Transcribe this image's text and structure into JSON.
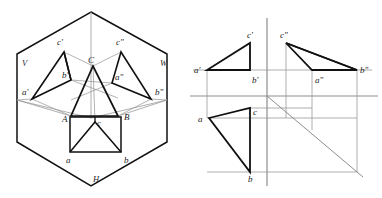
{
  "figure": {
    "background_color": "#ffffff",
    "heavy_line_color": "#111111",
    "light_line_color": "#9a9a9a",
    "axis_line_color": "#8d8d8d",
    "label_color": "#1b1b1b"
  },
  "left_view": {
    "name": "pictorial-projection-box",
    "plane_labels": [
      {
        "id": "V",
        "text": "V",
        "x": 22,
        "y": 66
      },
      {
        "id": "W",
        "text": "W",
        "x": 160,
        "y": 66
      },
      {
        "id": "H",
        "text": "H",
        "x": 93,
        "y": 182
      }
    ],
    "point_labels": [
      {
        "id": "c-front",
        "text": "c'",
        "x": 57,
        "y": 45
      },
      {
        "id": "b-front",
        "text": "b'",
        "x": 62,
        "y": 78
      },
      {
        "id": "a-front",
        "text": "a'",
        "x": 22,
        "y": 95
      },
      {
        "id": "c-side",
        "text": "c\"",
        "x": 116,
        "y": 45
      },
      {
        "id": "a-side",
        "text": "a\"",
        "x": 115,
        "y": 80
      },
      {
        "id": "b-side",
        "text": "b\"",
        "x": 155,
        "y": 95
      },
      {
        "id": "C-space",
        "text": "C",
        "x": 88,
        "y": 63
      },
      {
        "id": "A-space",
        "text": "A",
        "x": 62,
        "y": 120
      },
      {
        "id": "B-space",
        "text": "B",
        "x": 124,
        "y": 118
      },
      {
        "id": "c-top",
        "text": "c",
        "x": 93,
        "y": 124
      },
      {
        "id": "a-top",
        "text": "a",
        "x": 66,
        "y": 161
      },
      {
        "id": "b-top",
        "text": "b",
        "x": 124,
        "y": 161
      }
    ],
    "hexagon_vertices": [
      {
        "x": 91,
        "y": 12
      },
      {
        "x": 167,
        "y": 54
      },
      {
        "x": 167,
        "y": 142
      },
      {
        "x": 91,
        "y": 186
      },
      {
        "x": 17,
        "y": 142
      },
      {
        "x": 17,
        "y": 54
      }
    ],
    "front_triangle": [
      {
        "id": "a'",
        "x": 32,
        "y": 99
      },
      {
        "id": "b'",
        "x": 71,
        "y": 80
      },
      {
        "id": "c'",
        "x": 64,
        "y": 52
      }
    ],
    "side_triangle": [
      {
        "id": "a\"",
        "x": 112,
        "y": 83
      },
      {
        "id": "b\"",
        "x": 151,
        "y": 99
      },
      {
        "id": "c\"",
        "x": 121,
        "y": 52
      }
    ],
    "space_triangle": [
      {
        "id": "A",
        "x": 71,
        "y": 116
      },
      {
        "id": "B",
        "x": 118,
        "y": 116
      },
      {
        "id": "C",
        "x": 93,
        "y": 66
      }
    ],
    "top_triangle": [
      {
        "id": "a",
        "x": 70,
        "y": 152
      },
      {
        "id": "b",
        "x": 121,
        "y": 152
      },
      {
        "id": "c",
        "x": 95,
        "y": 122
      }
    ],
    "top_rectangle": [
      {
        "x": 70,
        "y": 117
      },
      {
        "x": 121,
        "y": 117
      },
      {
        "x": 121,
        "y": 152
      },
      {
        "x": 70,
        "y": 152
      }
    ]
  },
  "right_view": {
    "name": "orthographic-three-view",
    "axes": {
      "vertical_x": 267,
      "vertical_y1": 18,
      "vertical_y2": 186,
      "horizontal_y": 96,
      "horizontal_x1": 190,
      "horizontal_x2": 378,
      "origin_x": 267,
      "origin_y": 96,
      "diagonal_from": {
        "x": 267,
        "y": 96
      },
      "diagonal_to": {
        "x": 363,
        "y": 177
      }
    },
    "point_labels": [
      {
        "id": "c-front",
        "text": "c'",
        "x": 253,
        "y": 37
      },
      {
        "id": "c-side",
        "text": "c\"",
        "x": 281,
        "y": 37
      },
      {
        "id": "a-front",
        "text": "a'",
        "x": 196,
        "y": 72
      },
      {
        "id": "b-front",
        "text": "b'",
        "x": 253,
        "y": 83
      },
      {
        "id": "a-side",
        "text": "a\"",
        "x": 318,
        "y": 83
      },
      {
        "id": "b-side",
        "text": "b\"",
        "x": 362,
        "y": 72
      },
      {
        "id": "a-top",
        "text": "a",
        "x": 200,
        "y": 124
      },
      {
        "id": "c-top",
        "text": "c",
        "x": 253,
        "y": 115
      },
      {
        "id": "b-top",
        "text": "b",
        "x": 253,
        "y": 180
      }
    ],
    "front_triangle": [
      {
        "id": "a'",
        "x": 207,
        "y": 70
      },
      {
        "id": "b'",
        "x": 250,
        "y": 70
      },
      {
        "id": "c'",
        "x": 250,
        "y": 43
      }
    ],
    "side_triangle": [
      {
        "id": "c\"",
        "x": 286,
        "y": 43
      },
      {
        "id": "a\"",
        "x": 312,
        "y": 70
      },
      {
        "id": "b\"",
        "x": 357,
        "y": 70
      }
    ],
    "top_triangle": [
      {
        "id": "a",
        "x": 209,
        "y": 118
      },
      {
        "id": "c",
        "x": 250,
        "y": 108
      },
      {
        "id": "b",
        "x": 250,
        "y": 172
      }
    ],
    "construction_lines": [
      {
        "from": {
          "x": 207,
          "y": 70
        },
        "to": {
          "x": 207,
          "y": 118
        }
      },
      {
        "from": {
          "x": 250,
          "y": 43
        },
        "to": {
          "x": 250,
          "y": 70
        }
      },
      {
        "from": {
          "x": 286,
          "y": 43
        },
        "to": {
          "x": 286,
          "y": 96
        }
      },
      {
        "from": {
          "x": 312,
          "y": 70
        },
        "to": {
          "x": 312,
          "y": 130
        }
      },
      {
        "from": {
          "x": 357,
          "y": 70
        },
        "to": {
          "x": 357,
          "y": 172
        }
      },
      {
        "from": {
          "x": 190,
          "y": 70
        },
        "to": {
          "x": 378,
          "y": 70
        }
      },
      {
        "from": {
          "x": 207,
          "y": 118
        },
        "to": {
          "x": 357,
          "y": 118
        }
      },
      {
        "from": {
          "x": 207,
          "y": 172
        },
        "to": {
          "x": 357,
          "y": 172
        }
      },
      {
        "from": {
          "x": 250,
          "y": 108
        },
        "to": {
          "x": 312,
          "y": 108
        }
      }
    ]
  }
}
